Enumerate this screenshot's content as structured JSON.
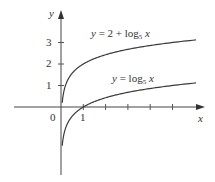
{
  "chart_data": {
    "type": "line",
    "title": "",
    "xlabel": "x",
    "ylabel": "y",
    "x_ticks": [
      1,
      2,
      3,
      4,
      5
    ],
    "x_tick_labels": [
      "0",
      "1"
    ],
    "y_ticks": [
      1,
      2,
      3
    ],
    "y_tick_labels": [
      "1",
      "2",
      "3"
    ],
    "xlim": [
      -2.5,
      6.5
    ],
    "ylim": [
      -3.2,
      4.4
    ],
    "grid": false,
    "legend": "none",
    "series": [
      {
        "name": "y = 2 + log5 x",
        "label_parts": {
          "prefix": "y = 2 + log",
          "sub": "5",
          "var": "x"
        },
        "function": "2 + log5(x)",
        "x": [
          0.05,
          0.1,
          0.25,
          0.5,
          1,
          2,
          3,
          4,
          5,
          6
        ],
        "values": [
          0.14,
          0.57,
          1.14,
          1.57,
          2.0,
          2.43,
          2.68,
          2.86,
          3.0,
          3.11
        ]
      },
      {
        "name": "y = log5 x",
        "label_parts": {
          "prefix": "y = log",
          "sub": "5",
          "var": "x"
        },
        "function": "log5(x)",
        "x": [
          0.05,
          0.1,
          0.25,
          0.5,
          1,
          2,
          3,
          4,
          5,
          6
        ],
        "values": [
          -1.86,
          -1.43,
          -0.86,
          -0.43,
          0.0,
          0.43,
          0.68,
          0.86,
          1.0,
          1.11
        ]
      }
    ],
    "colors": {
      "curve": "#3a3a3a",
      "axis": "#444444",
      "text": "#333333"
    }
  }
}
